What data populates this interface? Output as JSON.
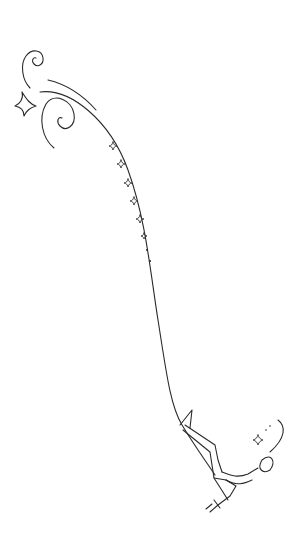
{
  "image": {
    "description": "Black line-art drawing on white: a long flowing ribbon curve from top-left spirals down to a figure (aerialist) hanging at the bottom right, with small four-pointed stars trailing alongside the curve.",
    "colors": {
      "background": "#ffffff",
      "ink": "#2a2a2a"
    },
    "elements": {
      "spirals": 2,
      "large_star": 1,
      "small_stars_trail": 6,
      "trail_dots": 2,
      "figure_star": 1
    }
  }
}
